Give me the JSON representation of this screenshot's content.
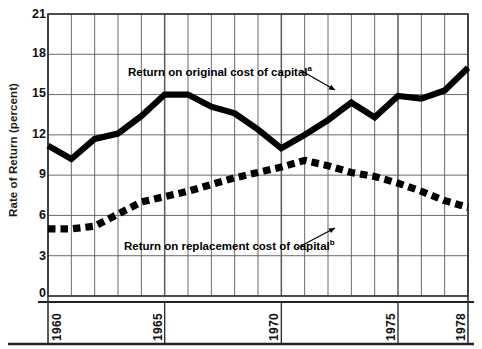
{
  "chart_data": {
    "type": "line",
    "title": "",
    "xlabel": "",
    "ylabel": "Rate of Return (percent)",
    "ylim": [
      0,
      21
    ],
    "xlim": [
      1960,
      1978
    ],
    "yticks": [
      0,
      3,
      6,
      9,
      12,
      15,
      18,
      21
    ],
    "xticks": [
      1960,
      1965,
      1970,
      1975,
      1978
    ],
    "grid": true,
    "legend_position": "inline-annotation",
    "x": [
      1960,
      1961,
      1962,
      1963,
      1964,
      1965,
      1966,
      1967,
      1968,
      1969,
      1970,
      1971,
      1972,
      1973,
      1974,
      1975,
      1976,
      1977,
      1978
    ],
    "series": [
      {
        "name": "Return on original cost of capital",
        "style": "solid-thick",
        "values": [
          11.2,
          10.2,
          11.7,
          12.1,
          13.4,
          15.0,
          15.0,
          14.1,
          13.6,
          12.4,
          11.0,
          12.0,
          13.1,
          14.4,
          13.3,
          14.9,
          14.7,
          15.3,
          17.0
        ]
      },
      {
        "name": "Return on replacement cost of capital",
        "style": "dashed-thick",
        "values": [
          5.0,
          5.0,
          5.2,
          6.1,
          7.0,
          7.4,
          7.8,
          8.3,
          8.8,
          9.2,
          9.6,
          10.1,
          9.7,
          9.2,
          8.9,
          8.4,
          7.8,
          7.1,
          6.6
        ]
      }
    ],
    "annotations": [
      {
        "text": "Return on original cost of capital",
        "superscript": "a",
        "points_to_series": "Return on original cost of capital"
      },
      {
        "text": "Return on replacement cost of capital",
        "superscript": "b",
        "points_to_series": "Return on replacement cost of capital"
      }
    ]
  },
  "axis": {
    "ylabel": "Rate of Return (percent)",
    "ytick_labels": [
      "21",
      "18",
      "15",
      "12",
      "9",
      "6",
      "3",
      "0"
    ],
    "xtick_labels": [
      "1960",
      "1965",
      "1970",
      "1975",
      "1978"
    ]
  },
  "colors": {
    "ink": "#111111",
    "grid": "#5a5a5a",
    "series": "#000000",
    "background": "#ffffff"
  }
}
